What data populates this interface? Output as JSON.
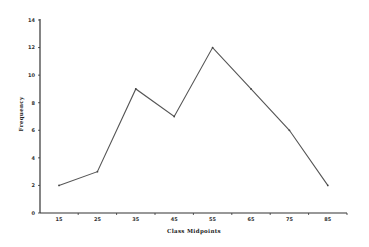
{
  "chart_data": {
    "type": "line",
    "title": "",
    "xlabel": "Class Midpoints",
    "ylabel": "Frequency",
    "categories": [
      "15",
      "25",
      "35",
      "45",
      "55",
      "65",
      "75",
      "85"
    ],
    "x": [
      15,
      25,
      35,
      45,
      55,
      65,
      75,
      85
    ],
    "values": [
      2,
      3,
      9,
      7,
      12,
      9,
      6,
      2
    ],
    "ylim": [
      0,
      14
    ],
    "yticks": [
      "0",
      "2",
      "4",
      "6",
      "8",
      "10",
      "12",
      "14"
    ],
    "grid": false,
    "legend": null,
    "colors": {
      "line": "#555555",
      "axis": "#333333"
    }
  }
}
